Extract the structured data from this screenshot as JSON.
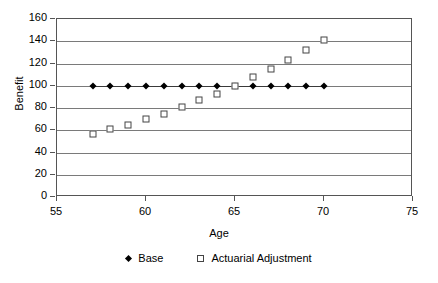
{
  "chart_data": {
    "type": "scatter",
    "title": "",
    "xlabel": "Age",
    "ylabel": "Benefit",
    "xlim": [
      55,
      75
    ],
    "ylim": [
      0,
      160
    ],
    "xticks": [
      55,
      60,
      65,
      70,
      75
    ],
    "yticks": [
      0,
      20,
      40,
      60,
      80,
      100,
      120,
      140,
      160
    ],
    "grid": "horizontal",
    "legend_position": "bottom",
    "x": [
      57,
      58,
      59,
      60,
      61,
      62,
      63,
      64,
      65,
      66,
      67,
      68,
      69,
      70
    ],
    "series": [
      {
        "name": "Base",
        "marker": "diamond",
        "color": "#000000",
        "values": [
          100,
          100,
          100,
          100,
          100,
          100,
          100,
          100,
          100,
          100,
          100,
          100,
          100,
          100
        ]
      },
      {
        "name": "Actuarial Adjustment",
        "marker": "square",
        "color": "#444444",
        "values": [
          57,
          61,
          65,
          70,
          75,
          81,
          87,
          93,
          100,
          108,
          115,
          123,
          132,
          141
        ]
      }
    ]
  },
  "legend": {
    "entries": [
      {
        "label": "Base",
        "marker": "diamond-marker-icon"
      },
      {
        "label": "Actuarial Adjustment",
        "marker": "square-marker-icon"
      }
    ]
  },
  "axes": {
    "y_title": "Benefit",
    "x_title": "Age",
    "y_tick_labels": [
      "160",
      "140",
      "120",
      "100",
      "80",
      "60",
      "40",
      "20",
      "0"
    ],
    "x_tick_labels": [
      "55",
      "60",
      "65",
      "70",
      "75"
    ]
  }
}
